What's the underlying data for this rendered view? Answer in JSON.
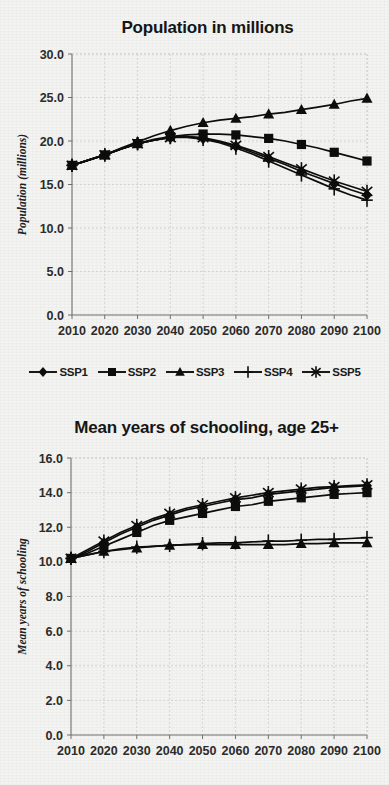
{
  "background_color": "#f3f3f1",
  "ink_color": "#0d0d0d",
  "legend": {
    "position": "between-charts",
    "items": [
      {
        "label": "SSP1",
        "marker": "diamond"
      },
      {
        "label": "SSP2",
        "marker": "square"
      },
      {
        "label": "SSP3",
        "marker": "triangle"
      },
      {
        "label": "SSP4",
        "marker": "plus"
      },
      {
        "label": "SSP5",
        "marker": "asterisk"
      }
    ]
  },
  "chart_data": [
    {
      "id": "population",
      "type": "line",
      "title": "Population in millions",
      "xlabel": "",
      "ylabel": "Population (millions)",
      "x": [
        2010,
        2015,
        2020,
        2025,
        2030,
        2035,
        2040,
        2045,
        2050,
        2055,
        2060,
        2065,
        2070,
        2075,
        2080,
        2085,
        2090,
        2095,
        2100
      ],
      "xlim": [
        2010,
        2100
      ],
      "ylim": [
        0.0,
        30.0
      ],
      "xticks": [
        2010,
        2020,
        2030,
        2040,
        2050,
        2060,
        2070,
        2080,
        2090,
        2100
      ],
      "xtick_labels": [
        "2010",
        "2020",
        "2030",
        "2040",
        "2050",
        "2060",
        "2070",
        "2080",
        "2090",
        "2100"
      ],
      "yticks": [
        0.0,
        5.0,
        10.0,
        15.0,
        20.0,
        25.0,
        30.0
      ],
      "ytick_labels": [
        "0.0",
        "5.0",
        "10.0",
        "15.0",
        "20.0",
        "25.0",
        "30.0"
      ],
      "grid": true,
      "series": [
        {
          "name": "SSP1",
          "marker": "diamond",
          "values": [
            17.2,
            17.8,
            18.4,
            19.1,
            19.7,
            20.1,
            20.4,
            20.5,
            20.3,
            19.9,
            19.4,
            18.7,
            18.0,
            17.3,
            16.5,
            15.8,
            15.1,
            14.4,
            13.8
          ]
        },
        {
          "name": "SSP2",
          "marker": "square",
          "values": [
            17.2,
            17.8,
            18.4,
            19.1,
            19.7,
            20.2,
            20.5,
            20.7,
            20.8,
            20.8,
            20.7,
            20.5,
            20.3,
            20.0,
            19.6,
            19.2,
            18.7,
            18.2,
            17.7
          ]
        },
        {
          "name": "SSP3",
          "marker": "triangle",
          "values": [
            17.2,
            17.8,
            18.4,
            19.2,
            19.9,
            20.6,
            21.2,
            21.7,
            22.1,
            22.4,
            22.6,
            22.8,
            23.1,
            23.3,
            23.6,
            23.9,
            24.2,
            24.6,
            24.9
          ]
        },
        {
          "name": "SSP4",
          "marker": "plus",
          "values": [
            17.2,
            17.8,
            18.4,
            19.1,
            19.7,
            20.1,
            20.4,
            20.4,
            20.2,
            19.8,
            19.2,
            18.5,
            17.7,
            16.9,
            16.1,
            15.3,
            14.5,
            13.8,
            13.2
          ]
        },
        {
          "name": "SSP5",
          "marker": "asterisk",
          "values": [
            17.2,
            17.8,
            18.4,
            19.1,
            19.7,
            20.1,
            20.4,
            20.5,
            20.4,
            20.0,
            19.5,
            18.9,
            18.2,
            17.5,
            16.8,
            16.1,
            15.4,
            14.8,
            14.2
          ]
        }
      ]
    },
    {
      "id": "schooling",
      "type": "line",
      "title": "Mean years of schooling, age 25+",
      "xlabel": "",
      "ylabel": "Mean years of schooling",
      "x": [
        2010,
        2015,
        2020,
        2025,
        2030,
        2035,
        2040,
        2045,
        2050,
        2055,
        2060,
        2065,
        2070,
        2075,
        2080,
        2085,
        2090,
        2095,
        2100
      ],
      "xlim": [
        2010,
        2100
      ],
      "ylim": [
        0.0,
        16.0
      ],
      "xticks": [
        2010,
        2020,
        2030,
        2040,
        2050,
        2060,
        2070,
        2080,
        2090,
        2100
      ],
      "xtick_labels": [
        "2010",
        "2020",
        "2030",
        "2040",
        "2050",
        "2060",
        "2070",
        "2080",
        "2090",
        "2100"
      ],
      "yticks": [
        0.0,
        2.0,
        4.0,
        6.0,
        8.0,
        10.0,
        12.0,
        14.0,
        16.0
      ],
      "ytick_labels": [
        "0.0",
        "2.0",
        "4.0",
        "6.0",
        "8.0",
        "10.0",
        "12.0",
        "14.0",
        "16.0"
      ],
      "grid": true,
      "series": [
        {
          "name": "SSP1",
          "marker": "diamond",
          "values": [
            10.2,
            10.6,
            11.1,
            11.6,
            12.0,
            12.4,
            12.7,
            13.0,
            13.2,
            13.4,
            13.6,
            13.7,
            13.9,
            14.0,
            14.1,
            14.2,
            14.3,
            14.35,
            14.4
          ]
        },
        {
          "name": "SSP2",
          "marker": "square",
          "values": [
            10.2,
            10.5,
            10.9,
            11.3,
            11.7,
            12.1,
            12.4,
            12.6,
            12.8,
            13.0,
            13.2,
            13.3,
            13.5,
            13.6,
            13.7,
            13.8,
            13.9,
            13.95,
            14.0
          ]
        },
        {
          "name": "SSP3",
          "marker": "triangle",
          "values": [
            10.2,
            10.4,
            10.6,
            10.7,
            10.8,
            10.9,
            10.95,
            11.0,
            11.0,
            11.0,
            11.0,
            11.0,
            11.0,
            11.0,
            11.05,
            11.05,
            11.1,
            11.1,
            11.1
          ]
        },
        {
          "name": "SSP4",
          "marker": "plus",
          "values": [
            10.2,
            10.4,
            10.6,
            10.75,
            10.85,
            10.9,
            10.95,
            11.0,
            11.05,
            11.1,
            11.1,
            11.15,
            11.2,
            11.2,
            11.25,
            11.3,
            11.3,
            11.35,
            11.4
          ]
        },
        {
          "name": "SSP5",
          "marker": "asterisk",
          "values": [
            10.2,
            10.7,
            11.2,
            11.7,
            12.1,
            12.5,
            12.8,
            13.1,
            13.3,
            13.5,
            13.7,
            13.85,
            14.0,
            14.1,
            14.2,
            14.3,
            14.35,
            14.4,
            14.45
          ]
        }
      ]
    }
  ]
}
